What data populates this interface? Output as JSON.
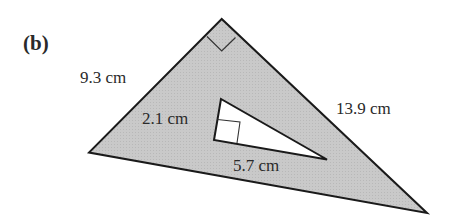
{
  "part_label": "(b)",
  "outer_triangle": {
    "fill": "#c8c8c8",
    "stroke": "#1a1a1a",
    "vertices": {
      "top": [
        221.7,
        19
      ],
      "left": [
        89,
        152.5
      ],
      "right": [
        427,
        213
      ]
    },
    "right_angle_at": "top",
    "sides": {
      "left": "9.3 cm",
      "right": "13.9 cm"
    }
  },
  "inner_triangle": {
    "fill": "#ffffff",
    "stroke": "#1a1a1a",
    "vertices": {
      "top": [
        221,
        99
      ],
      "bottom_left": [
        214,
        140
      ],
      "right": [
        327,
        159.5
      ]
    },
    "right_angle_at": "bottom_left",
    "sides": {
      "left": "2.1 cm",
      "bottom": "5.7 cm"
    }
  }
}
